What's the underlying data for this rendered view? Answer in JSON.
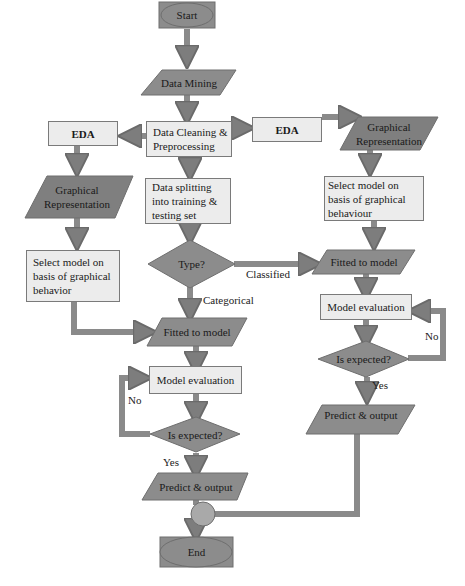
{
  "flowchart": {
    "colors": {
      "shape_fill_dark": "#8c8c8c",
      "shape_fill_light": "#ececec",
      "stroke": "#6e6e6e",
      "arrow": "#808080"
    },
    "nodes": {
      "start": "Start",
      "data_mining": "Data Mining",
      "data_cleaning": "Data Cleaning & Preprocessing",
      "eda_left": "EDA",
      "eda_right": "EDA",
      "graph_rep_left": "Graphical Representation",
      "graph_rep_right": "Graphical Representation",
      "data_splitting": "Data splitting into training & testing set",
      "select_model_left": "Select model on basis of graphical behavior",
      "select_model_right": "Select model on basis of graphical behaviour",
      "type_decision": "Type?",
      "fitted_left": "Fitted to model",
      "fitted_right": "Fitted to model",
      "model_eval_left": "Model evaluation",
      "model_eval_right": "Model evaluation",
      "is_expected_left": "Is expected?",
      "is_expected_right": "Is expected?",
      "predict_left": "Predict & output",
      "predict_right": "Predict & output",
      "end": "End"
    },
    "edge_labels": {
      "categorical": "Categorical",
      "classified": "Classified",
      "no_left": "No",
      "yes_left": "Yes",
      "no_right": "No",
      "yes_right": "Yes"
    }
  }
}
